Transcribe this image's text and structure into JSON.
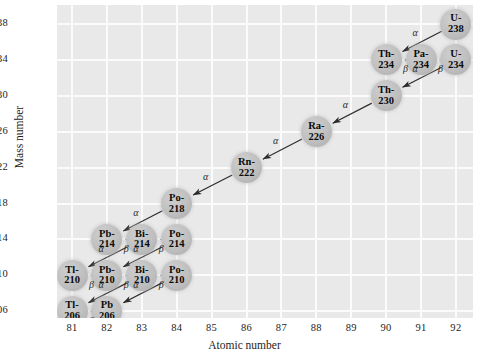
{
  "axes": {
    "x_title": "Atomic number",
    "y_title": "Mass number",
    "x_ticks": [
      "81",
      "82",
      "83",
      "84",
      "85",
      "86",
      "87",
      "88",
      "89",
      "90",
      "91",
      "92"
    ],
    "y_ticks": [
      "238",
      "234",
      "230",
      "226",
      "222",
      "218",
      "214",
      "210",
      "206"
    ]
  },
  "chart_data": {
    "type": "scatter",
    "title": "",
    "xlabel": "Atomic number",
    "ylabel": "Mass number",
    "xlim": [
      80.5,
      92.5
    ],
    "ylim": [
      204.5,
      239.5
    ],
    "grid": true,
    "legend": null,
    "nodes": [
      {
        "id": "U-238",
        "element": "U-",
        "mass": "238",
        "z": 92,
        "a": 238
      },
      {
        "id": "Th-234",
        "element": "Th-",
        "mass": "234",
        "z": 90,
        "a": 234
      },
      {
        "id": "Pa-234",
        "element": "Pa-",
        "mass": "234",
        "z": 91,
        "a": 234
      },
      {
        "id": "U-234",
        "element": "U-",
        "mass": "234",
        "z": 92,
        "a": 234
      },
      {
        "id": "Th-230",
        "element": "Th-",
        "mass": "230",
        "z": 90,
        "a": 230
      },
      {
        "id": "Ra-226",
        "element": "Ra-",
        "mass": "226",
        "z": 88,
        "a": 226
      },
      {
        "id": "Rn-222",
        "element": "Rn-",
        "mass": "222",
        "z": 86,
        "a": 222
      },
      {
        "id": "Po-218",
        "element": "Po-",
        "mass": "218",
        "z": 84,
        "a": 218
      },
      {
        "id": "Pb-214",
        "element": "Pb-",
        "mass": "214",
        "z": 82,
        "a": 214
      },
      {
        "id": "Bi-214",
        "element": "Bi-",
        "mass": "214",
        "z": 83,
        "a": 214
      },
      {
        "id": "Po-214",
        "element": "Po-",
        "mass": "214",
        "z": 84,
        "a": 214
      },
      {
        "id": "Tl-210",
        "element": "Tl-",
        "mass": "210",
        "z": 81,
        "a": 210
      },
      {
        "id": "Pb-210",
        "element": "Pb-",
        "mass": "210",
        "z": 82,
        "a": 210
      },
      {
        "id": "Bi-210",
        "element": "Bi-",
        "mass": "210",
        "z": 83,
        "a": 210
      },
      {
        "id": "Po-210",
        "element": "Po-",
        "mass": "210",
        "z": 84,
        "a": 210
      },
      {
        "id": "Tl-206",
        "element": "Tl-",
        "mass": "206",
        "z": 81,
        "a": 206
      },
      {
        "id": "Pb-206",
        "element": "Pb",
        "mass": "206",
        "z": 82,
        "a": 206
      }
    ],
    "edges": [
      {
        "from": "U-238",
        "to": "Th-234",
        "mode": "alpha",
        "label": "α"
      },
      {
        "from": "Pa-234",
        "to": "Th-234",
        "mode": "beta",
        "label": "β"
      },
      {
        "from": "U-234",
        "to": "Pa-234",
        "mode": "beta",
        "label": "β"
      },
      {
        "from": "U-234",
        "to": "Th-230",
        "mode": "alpha",
        "label": "α"
      },
      {
        "from": "Th-230",
        "to": "Ra-226",
        "mode": "alpha",
        "label": "α"
      },
      {
        "from": "Ra-226",
        "to": "Rn-222",
        "mode": "alpha",
        "label": "α"
      },
      {
        "from": "Rn-222",
        "to": "Po-218",
        "mode": "alpha",
        "label": "α"
      },
      {
        "from": "Po-218",
        "to": "Pb-214",
        "mode": "alpha",
        "label": "α"
      },
      {
        "from": "Bi-214",
        "to": "Pb-214",
        "mode": "beta",
        "label": "β"
      },
      {
        "from": "Po-214",
        "to": "Bi-214",
        "mode": "beta",
        "label": "β"
      },
      {
        "from": "Bi-214",
        "to": "Tl-210",
        "mode": "alpha",
        "label": "α"
      },
      {
        "from": "Po-214",
        "to": "Pb-210",
        "mode": "alpha",
        "label": "α"
      },
      {
        "from": "Pb-210",
        "to": "Tl-210",
        "mode": "beta",
        "label": "β"
      },
      {
        "from": "Bi-210",
        "to": "Pb-210",
        "mode": "beta",
        "label": "β"
      },
      {
        "from": "Po-210",
        "to": "Bi-210",
        "mode": "beta",
        "label": "β"
      },
      {
        "from": "Bi-210",
        "to": "Tl-206",
        "mode": "alpha",
        "label": "α"
      },
      {
        "from": "Po-210",
        "to": "Pb-206",
        "mode": "alpha",
        "label": "α"
      },
      {
        "from": "Pb-206",
        "to": "Tl-206",
        "mode": "beta",
        "label": "β"
      }
    ]
  }
}
